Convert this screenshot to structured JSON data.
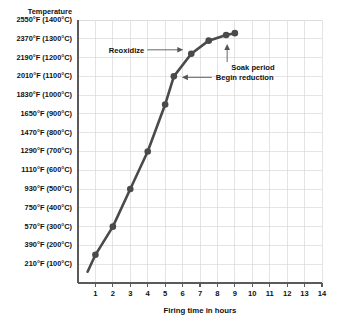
{
  "chart_data": {
    "type": "line",
    "title": "",
    "xlabel": "Firing time in hours",
    "ylabel": "Temperature",
    "xlim": [
      0,
      14
    ],
    "ylim": [
      0,
      1400
    ],
    "grid": true,
    "legend": "none",
    "x_ticks": [
      "1",
      "2",
      "3",
      "4",
      "5",
      "6",
      "7",
      "8",
      "9",
      "10",
      "11",
      "12",
      "13",
      "14"
    ],
    "y_ticks": [
      "210°F (100°C)",
      "390°F (200°C)",
      "570°F (300°C)",
      "750°F (400°C)",
      "930°F (500°C)",
      "1110°F (600°C)",
      "1290°F (700°C)",
      "1470°F (800°C)",
      "1650°F (900°C)",
      "1830°F (1000°C)",
      "2010°F (1100°C)",
      "2190°F (1200°C)",
      "2370°F (1300°C)",
      "2550°F (1400°C)"
    ],
    "y_tick_values_c": [
      100,
      200,
      300,
      400,
      500,
      600,
      700,
      800,
      900,
      1000,
      1100,
      1200,
      1300,
      1400
    ],
    "series": [
      {
        "name": "Firing curve",
        "x": [
          0.55,
          1,
          2,
          3,
          4,
          5,
          5.5,
          6.5,
          7.5,
          8.5,
          9
        ],
        "y_celsius": [
          60,
          150,
          300,
          500,
          700,
          950,
          1100,
          1220,
          1290,
          1320,
          1330
        ],
        "marker_at": [
          false,
          true,
          true,
          true,
          true,
          true,
          true,
          true,
          true,
          true,
          true
        ]
      }
    ],
    "annotations": [
      {
        "text": "Reoxidize",
        "target_x": 6.5,
        "target_y_celsius": 1220,
        "arrow": "right"
      },
      {
        "text": "Begin reduction",
        "target_x": 5.5,
        "target_y_celsius": 1100,
        "arrow": "left"
      },
      {
        "text": "Soak period",
        "target_x": 8.5,
        "target_y_celsius": 1320,
        "arrow": "up"
      }
    ],
    "colors": {
      "line": "#4a4a4a",
      "marker": "#4a4a4a",
      "grid": "#d9d9d9",
      "axis": "#5a5a5a",
      "text": "#111111",
      "background": "#ffffff"
    }
  }
}
